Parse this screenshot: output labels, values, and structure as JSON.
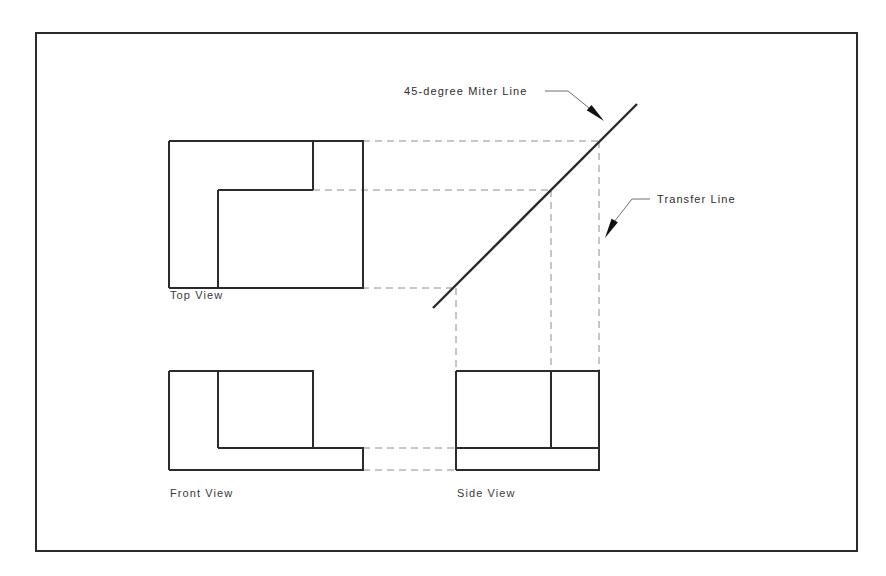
{
  "drawing": {
    "title": "Orthographic Projection with 45-degree Miter Line",
    "frame": {
      "x": 36,
      "y": 33,
      "width": 821,
      "height": 518,
      "stroke": "#2b2b2b",
      "stroke_width": 2
    },
    "colors": {
      "object_line": "#2b2b2b",
      "projection_line": "#8c8c8c",
      "miter_line": "#2b2b2b",
      "leader_line": "#6e6e6e",
      "text": "#3a3a3a",
      "background": "#ffffff"
    },
    "views": [
      {
        "id": "top-view",
        "label": "Top View",
        "label_x": 170,
        "label_y": 299,
        "bounds": {
          "left": 169,
          "top": 141,
          "right": 363,
          "bottom": 288
        },
        "outline": "169,141 363,141 363,288 169,288",
        "internal_lines": [
          {
            "name": "notch-vertical",
            "x1": 313,
            "y1": 141,
            "x2": 313,
            "y2": 190
          },
          {
            "name": "notch-horizontal",
            "x1": 218,
            "y1": 190,
            "x2": 313,
            "y2": 190
          },
          {
            "name": "step-vertical",
            "x1": 218,
            "y1": 190,
            "x2": 218,
            "y2": 288
          }
        ]
      },
      {
        "id": "front-view",
        "label": "Front View",
        "label_x": 170,
        "label_y": 497,
        "bounds": {
          "left": 169,
          "top": 371,
          "right": 363,
          "bottom": 470
        },
        "outline": "169,371 313,371 313,448 363,448 363,470 169,470",
        "internal_lines": [
          {
            "name": "step-vertical",
            "x1": 218,
            "y1": 371,
            "x2": 218,
            "y2": 448
          },
          {
            "name": "step-horizontal",
            "x1": 218,
            "y1": 448,
            "x2": 313,
            "y2": 448
          }
        ]
      },
      {
        "id": "side-view",
        "label": "Side View",
        "label_x": 457,
        "label_y": 497,
        "bounds": {
          "left": 456,
          "top": 371,
          "right": 599,
          "bottom": 470
        },
        "outline": "456,371 599,371 599,470 456,470",
        "internal_lines": [
          {
            "name": "divider-vertical",
            "x1": 551,
            "y1": 371,
            "x2": 551,
            "y2": 448
          },
          {
            "name": "base-horizontal",
            "x1": 456,
            "y1": 448,
            "x2": 599,
            "y2": 448
          }
        ]
      }
    ],
    "miter_line": {
      "name": "45-degree-miter-line",
      "x1": 433,
      "y1": 308,
      "x2": 637,
      "y2": 104,
      "stroke_width": 2.4
    },
    "projection_lines": {
      "horizontal_top_to_miter": [
        {
          "name": "projector-top-edge",
          "x1": 363,
          "y1": 141,
          "x2": 599,
          "y2": 141
        },
        {
          "name": "projector-notch",
          "x1": 313,
          "y1": 190,
          "x2": 551,
          "y2": 190
        },
        {
          "name": "projector-bottom-edge",
          "x1": 218,
          "y1": 288,
          "x2": 456,
          "y2": 288
        }
      ],
      "vertical_miter_to_side": [
        {
          "name": "transfer-left",
          "x1": 456,
          "y1": 288,
          "x2": 456,
          "y2": 371
        },
        {
          "name": "transfer-middle",
          "x1": 551,
          "y1": 190,
          "x2": 551,
          "y2": 371
        },
        {
          "name": "transfer-right",
          "x1": 599,
          "y1": 141,
          "x2": 599,
          "y2": 371
        }
      ],
      "horizontal_front_to_side": [
        {
          "name": "height-projector-upper",
          "x1": 363,
          "y1": 448,
          "x2": 456,
          "y2": 448
        },
        {
          "name": "height-projector-lower",
          "x1": 363,
          "y1": 470,
          "x2": 456,
          "y2": 470
        }
      ]
    },
    "annotations": [
      {
        "id": "miter-annotation",
        "text": "45-degree Miter Line",
        "text_x": 404,
        "text_y": 95,
        "text_anchor": "start",
        "leader": "545,91 568,91 594,112",
        "arrow": {
          "tip_x": 604,
          "tip_y": 121,
          "angle": 42
        }
      },
      {
        "id": "transfer-annotation",
        "text": "Transfer Line",
        "text_x": 657,
        "text_y": 203,
        "text_anchor": "start",
        "leader": "650,199 632,199 614,222",
        "arrow": {
          "tip_x": 605,
          "tip_y": 238,
          "angle": 119
        }
      }
    ]
  }
}
